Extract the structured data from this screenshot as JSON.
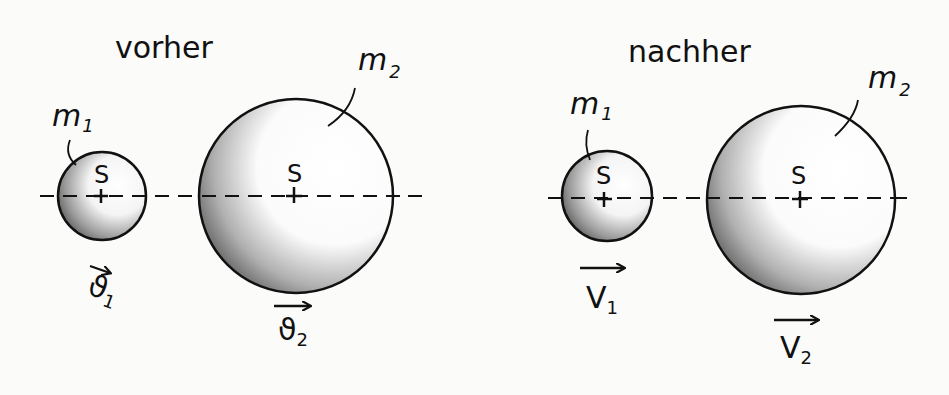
{
  "panels": [
    {
      "title": "vorher",
      "bodies": [
        {
          "mass_label": "m",
          "mass_sub": "1",
          "center_label": "S",
          "velocity_label": "ϑ",
          "velocity_sub": "1"
        },
        {
          "mass_label": "m",
          "mass_sub": "2",
          "center_label": "S",
          "velocity_label": "ϑ",
          "velocity_sub": "2"
        }
      ]
    },
    {
      "title": "nachher",
      "bodies": [
        {
          "mass_label": "m",
          "mass_sub": "1",
          "center_label": "S",
          "velocity_label": "V",
          "velocity_sub": "1"
        },
        {
          "mass_label": "m",
          "mass_sub": "2",
          "center_label": "S",
          "velocity_label": "V",
          "velocity_sub": "2"
        }
      ]
    }
  ],
  "colors": {
    "stroke": "#111111",
    "shade_dark": "#555555",
    "shade_light": "#ffffff",
    "paper": "#fbfbfa"
  }
}
